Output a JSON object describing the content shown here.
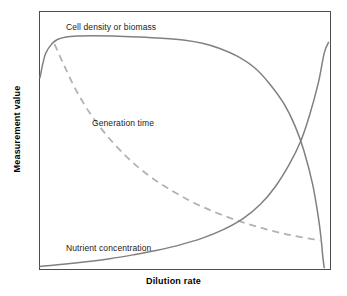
{
  "chart_data": {
    "type": "line",
    "title": "",
    "subtitle": "",
    "xlabel": "Dilution rate",
    "ylabel": "Measurement value",
    "xlim": [
      0,
      1
    ],
    "ylim": [
      0,
      1
    ],
    "grid": false,
    "legend": "inline-curve-labels",
    "axis_ticks": false,
    "frame": "full-box",
    "annotations": [
      {
        "text": "Cell density or biomass",
        "x": 0.12,
        "y": 0.95
      },
      {
        "text": "Generation time",
        "x": 0.2,
        "y": 0.6
      },
      {
        "text": "Nutrient concentration",
        "x": 0.12,
        "y": 0.12
      }
    ],
    "series": [
      {
        "name": "Cell density or biomass",
        "style": "solid",
        "color": "#808080",
        "x": [
          0.0,
          0.01,
          0.02,
          0.04,
          0.06,
          0.09,
          0.13,
          0.18,
          0.25,
          0.34,
          0.42,
          0.5,
          0.56,
          0.62,
          0.68,
          0.74,
          0.79,
          0.84,
          0.88,
          0.91,
          0.94,
          0.96,
          0.97,
          0.975,
          0.98
        ],
        "y": [
          0.745,
          0.8,
          0.84,
          0.875,
          0.893,
          0.903,
          0.907,
          0.908,
          0.907,
          0.903,
          0.898,
          0.89,
          0.878,
          0.858,
          0.828,
          0.783,
          0.723,
          0.645,
          0.555,
          0.46,
          0.33,
          0.2,
          0.11,
          0.05,
          0.005
        ]
      },
      {
        "name": "Generation time",
        "style": "dashed",
        "color": "#b2b2b2",
        "x": [
          0.05,
          0.08,
          0.12,
          0.17,
          0.23,
          0.3,
          0.37,
          0.45,
          0.53,
          0.61,
          0.69,
          0.77,
          0.85,
          0.93,
          0.97
        ],
        "y": [
          0.875,
          0.8,
          0.705,
          0.61,
          0.52,
          0.435,
          0.368,
          0.308,
          0.258,
          0.218,
          0.185,
          0.158,
          0.135,
          0.118,
          0.112
        ]
      },
      {
        "name": "Nutrient concentration",
        "style": "solid",
        "color": "#808080",
        "x": [
          0.0,
          0.08,
          0.16,
          0.24,
          0.32,
          0.4,
          0.48,
          0.56,
          0.63,
          0.7,
          0.76,
          0.81,
          0.86,
          0.9,
          0.93,
          0.96,
          0.98,
          0.995
        ],
        "y": [
          0.01,
          0.018,
          0.028,
          0.04,
          0.055,
          0.072,
          0.093,
          0.12,
          0.152,
          0.196,
          0.252,
          0.318,
          0.408,
          0.5,
          0.6,
          0.725,
          0.84,
          0.882
        ]
      }
    ]
  },
  "axes": {
    "x_title": "Dilution rate",
    "y_title": "Measurement value"
  },
  "labels": {
    "biomass": "Cell density or biomass",
    "generation": "Generation time",
    "nutrient": "Nutrient concentration"
  },
  "colors": {
    "frame": "#4d4d4d",
    "solid_curve": "#808080",
    "dashed_curve": "#b2b2b2",
    "text": "#000000",
    "background": "#ffffff"
  }
}
